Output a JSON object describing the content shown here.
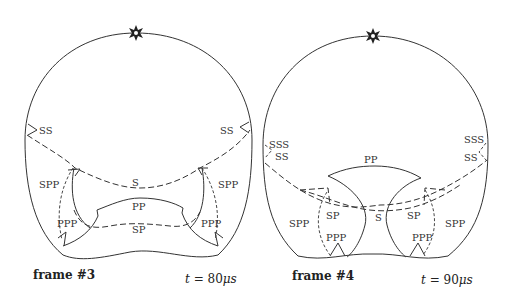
{
  "frames": [
    {
      "caption": "frame #3",
      "time_var": "t",
      "time_eq": " = 80",
      "time_unit": "μs",
      "source_icon": "star-source-icon",
      "labels": {
        "ss_left": "SS",
        "ss_right": "SS",
        "s": "S",
        "pp": "PP",
        "sp": "SP",
        "spp_left": "SPP",
        "spp_right": "SPP",
        "ppp_left": "PPP",
        "ppp_right": "PPP"
      }
    },
    {
      "caption": "frame #4",
      "time_var": "t",
      "time_eq": " = 90",
      "time_unit": "μs",
      "source_icon": "star-source-icon",
      "labels": {
        "sss_left": "SSS",
        "ss_left": "SS",
        "sss_right": "SSS",
        "ss_right": "SS",
        "pp": "PP",
        "sp_left": "SP",
        "s": "S",
        "sp_right": "SP",
        "spp_left": "SPP",
        "spp_right": "SPP",
        "ppp_left": "PPP",
        "ppp_right": "PPP"
      }
    }
  ]
}
